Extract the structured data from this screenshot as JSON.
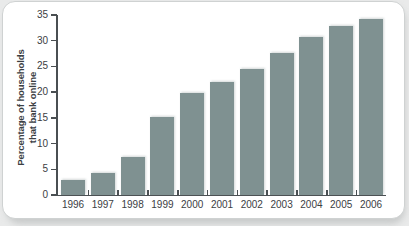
{
  "chart_data": {
    "type": "bar",
    "title": "",
    "xlabel": "",
    "ylabel": "Percentage of households that bank online",
    "ylabel_lines": [
      "Percentage of households",
      "that bank online"
    ],
    "categories": [
      "1996",
      "1997",
      "1998",
      "1999",
      "2000",
      "2001",
      "2002",
      "2003",
      "2004",
      "2005",
      "2006"
    ],
    "values": [
      3.0,
      4.3,
      7.4,
      15.1,
      19.8,
      22.0,
      24.5,
      27.6,
      30.8,
      32.8,
      34.2
    ],
    "ylim": [
      0,
      35
    ],
    "yticks": [
      0,
      5,
      10,
      15,
      20,
      25,
      30,
      35
    ],
    "ytick_labels": [
      "0",
      "5",
      "10",
      "15",
      "20",
      "25",
      "30",
      "35"
    ],
    "grid": false,
    "legend": null,
    "bar_color": "#7f9191",
    "axis_color": "#4a4f52",
    "text_color": "#3b4043",
    "background_color": "#ffffff",
    "page_background_color": "#e9eaea"
  }
}
